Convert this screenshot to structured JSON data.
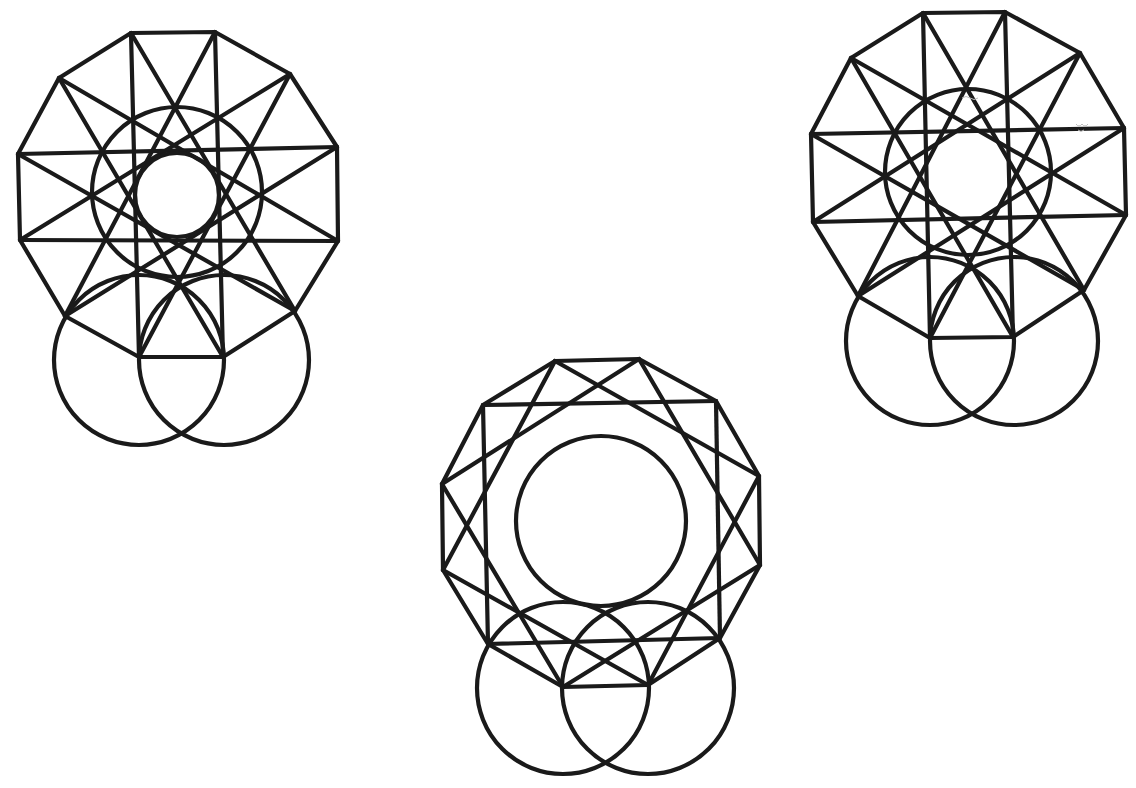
{
  "canvas": {
    "width": 1136,
    "height": 788,
    "background": "#ffffff",
    "ink": "#1a1a1a"
  },
  "figures": [
    {
      "id": "figure-left",
      "description": "12-gon with {12/5} star lines, two inner concentric circles, and two lower overlapping circles",
      "vertices": [
        [
          131,
          33
        ],
        [
          215,
          32
        ],
        [
          290,
          74
        ],
        [
          337,
          147
        ],
        [
          338,
          241
        ],
        [
          295,
          311
        ],
        [
          223,
          357
        ],
        [
          139,
          357
        ],
        [
          65,
          316
        ],
        [
          20,
          240
        ],
        [
          18,
          154
        ],
        [
          59,
          78
        ]
      ],
      "star_step": 5,
      "inner_circles": [
        {
          "cx": 177,
          "cy": 195,
          "r": 42
        },
        {
          "cx": 177,
          "cy": 192,
          "r": 85
        }
      ],
      "lower_circles": [
        {
          "cx": 139,
          "cy": 360,
          "r": 85
        },
        {
          "cx": 224,
          "cy": 360,
          "r": 85
        }
      ]
    },
    {
      "id": "figure-right",
      "description": "12-gon with {12/5} star lines, one large inner circle, and two lower overlapping circles",
      "vertices": [
        [
          923,
          13
        ],
        [
          1005,
          12
        ],
        [
          1080,
          53
        ],
        [
          1124,
          128
        ],
        [
          1126,
          215
        ],
        [
          1084,
          290
        ],
        [
          1013,
          337
        ],
        [
          930,
          338
        ],
        [
          858,
          296
        ],
        [
          813,
          222
        ],
        [
          811,
          134
        ],
        [
          851,
          58
        ]
      ],
      "star_step": 5,
      "inner_circles": [
        {
          "cx": 968,
          "cy": 172,
          "r": 83
        }
      ],
      "lower_circles": [
        {
          "cx": 930,
          "cy": 341,
          "r": 84
        },
        {
          "cx": 1014,
          "cy": 341,
          "r": 84
        }
      ]
    },
    {
      "id": "figure-center",
      "description": "12-gon with {12/3} star lines (three squares), one inner circle, and two lower overlapping circles",
      "vertices": [
        [
          555,
          361
        ],
        [
          639,
          359
        ],
        [
          716,
          401
        ],
        [
          759,
          476
        ],
        [
          760,
          565
        ],
        [
          720,
          638
        ],
        [
          648,
          685
        ],
        [
          563,
          687
        ],
        [
          488,
          644
        ],
        [
          443,
          570
        ],
        [
          442,
          484
        ],
        [
          483,
          405
        ]
      ],
      "star_step": 3,
      "inner_circles": [
        {
          "cx": 601,
          "cy": 521,
          "r": 85
        }
      ],
      "lower_circles": [
        {
          "cx": 563,
          "cy": 688,
          "r": 86
        },
        {
          "cx": 648,
          "cy": 688,
          "r": 86
        }
      ]
    }
  ]
}
